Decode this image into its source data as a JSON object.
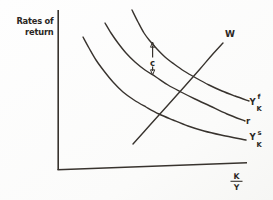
{
  "figure": {
    "background": "#fdfdfc",
    "ink_color": "#38332e",
    "y_axis_title": "Rates of return",
    "x_axis_title": "K/Y",
    "labels": [
      {
        "name": "y-axis-title-line-1",
        "text": "Rates of",
        "x": 53.5,
        "y": 23.5,
        "anchor": "end",
        "size": 8.3,
        "weight": "bold"
      },
      {
        "name": "y-axis-title-line-2",
        "text": "return",
        "x": 53.5,
        "y": 34.5,
        "anchor": "end",
        "size": 8.3,
        "weight": "bold"
      },
      {
        "name": "w-curve-label",
        "text": "W",
        "x": 225,
        "y": 37,
        "anchor": "start",
        "size": 9,
        "weight": "bold"
      },
      {
        "name": "ykf-label-base",
        "text": "Y",
        "x": 249.5,
        "y": 104.5,
        "anchor": "start",
        "size": 8.5,
        "weight": "bold"
      },
      {
        "name": "ykf-label-sup",
        "text": "f",
        "x": 257.5,
        "y": 99,
        "anchor": "start",
        "size": 6.8,
        "weight": "bold"
      },
      {
        "name": "ykf-label-sub",
        "text": "K",
        "x": 256.5,
        "y": 111,
        "anchor": "start",
        "size": 6.8,
        "weight": "bold"
      },
      {
        "name": "r-curve-label",
        "text": "r",
        "x": 246,
        "y": 124,
        "anchor": "start",
        "size": 8.5,
        "weight": "bold"
      },
      {
        "name": "yks-label-base",
        "text": "Y",
        "x": 249.5,
        "y": 140,
        "anchor": "start",
        "size": 8.5,
        "weight": "bold"
      },
      {
        "name": "yks-label-sup",
        "text": "s",
        "x": 257.5,
        "y": 134.5,
        "anchor": "start",
        "size": 6.8,
        "weight": "bold"
      },
      {
        "name": "yks-label-sub",
        "text": "K",
        "x": 256.5,
        "y": 146.5,
        "anchor": "start",
        "size": 6.8,
        "weight": "bold"
      },
      {
        "name": "gap-annotation-label",
        "text": "c",
        "x": 152.5,
        "y": 65.5,
        "anchor": "middle",
        "size": 8.5,
        "weight": "bold"
      },
      {
        "name": "x-axis-title-numerator",
        "text": "K",
        "x": 236.5,
        "y": 179,
        "anchor": "middle",
        "size": 7.8,
        "weight": "bold"
      },
      {
        "name": "x-axis-title-denominator",
        "text": "Y",
        "x": 236.5,
        "y": 190,
        "anchor": "middle",
        "size": 7.8,
        "weight": "bold"
      }
    ],
    "axis_lines": [
      {
        "name": "y-axis-line",
        "x1": 58.2,
        "y1": 10,
        "x2": 58.2,
        "y2": 170,
        "width": 1.6
      },
      {
        "name": "x-axis-line",
        "x1": 57.5,
        "y1": 169.8,
        "x2": 247,
        "y2": 162.8,
        "width": 1.6
      },
      {
        "name": "fraction-bar",
        "x1": 230.5,
        "y1": 181.3,
        "x2": 242.5,
        "y2": 181.3,
        "width": 1.1
      }
    ],
    "gap_arrow": {
      "shafts": [
        {
          "name": "gap-arrow-shaft-top",
          "x1": 152.6,
          "y1": 45.5,
          "x2": 152.6,
          "y2": 57.5
        },
        {
          "name": "gap-arrow-shaft-bottom",
          "x1": 152.6,
          "y1": 66.5,
          "x2": 152.6,
          "y2": 71
        }
      ],
      "heads": [
        {
          "name": "gap-arrowhead-up",
          "points": [
            [
              152.6,
              42
            ],
            [
              150.5,
              47.2
            ],
            [
              154.7,
              47.2
            ]
          ]
        },
        {
          "name": "gap-arrowhead-down",
          "points": [
            [
              152.6,
              75
            ],
            [
              150.5,
              69.8
            ],
            [
              154.7,
              69.8
            ]
          ]
        }
      ],
      "width": 1.2
    }
  },
  "chart_data": {
    "type": "line",
    "title": "",
    "xlabel": "K/Y",
    "ylabel": "Rates of return",
    "axis_scale": "qualitative (no numeric ticks shown)",
    "grid": false,
    "legend_position": "labels at curve ends",
    "annotations": [
      {
        "text": "c",
        "kind": "two-headed vertical arrow",
        "between": [
          "Y_K^f curve",
          "r curve"
        ],
        "at_px": [
          152.6,
          58
        ]
      }
    ],
    "series": [
      {
        "name": "W",
        "label": "W",
        "shape": "rising nearly-straight line",
        "stroke_width": 1.4,
        "points_px": [
          [
            133,
            144
          ],
          [
            150,
            125
          ],
          [
            168,
            105
          ],
          [
            185,
            86
          ],
          [
            200,
            69
          ],
          [
            212,
            55
          ],
          [
            223,
            43
          ]
        ]
      },
      {
        "name": "YKf",
        "label": "Y_K^f",
        "shape": "downward convex curve (top)",
        "stroke_width": 1.4,
        "points_px": [
          [
            132,
            10
          ],
          [
            138,
            22
          ],
          [
            144,
            33
          ],
          [
            150,
            41
          ],
          [
            157,
            49
          ],
          [
            165,
            57
          ],
          [
            174,
            64
          ],
          [
            184,
            71
          ],
          [
            196,
            78
          ],
          [
            209,
            85
          ],
          [
            222,
            91
          ],
          [
            235,
            96
          ],
          [
            249,
            101
          ]
        ]
      },
      {
        "name": "r",
        "label": "r",
        "shape": "downward convex curve (middle)",
        "stroke_width": 1.4,
        "points_px": [
          [
            105,
            23
          ],
          [
            111,
            33
          ],
          [
            118,
            43
          ],
          [
            126,
            53
          ],
          [
            135,
            62
          ],
          [
            145,
            70
          ],
          [
            156,
            77
          ],
          [
            168,
            85
          ],
          [
            181,
            92
          ],
          [
            195,
            99
          ],
          [
            210,
            106
          ],
          [
            227,
            114
          ],
          [
            245,
            121
          ]
        ]
      },
      {
        "name": "YKs",
        "label": "Y_K^s",
        "shape": "downward convex curve (bottom)",
        "stroke_width": 1.4,
        "points_px": [
          [
            83,
            37
          ],
          [
            89,
            48
          ],
          [
            96,
            60
          ],
          [
            104,
            71
          ],
          [
            113,
            82
          ],
          [
            123,
            92
          ],
          [
            134,
            100
          ],
          [
            146,
            107
          ],
          [
            159,
            114
          ],
          [
            173,
            120
          ],
          [
            188,
            126
          ],
          [
            204,
            131
          ],
          [
            221,
            135
          ],
          [
            246,
            140
          ]
        ]
      }
    ]
  }
}
